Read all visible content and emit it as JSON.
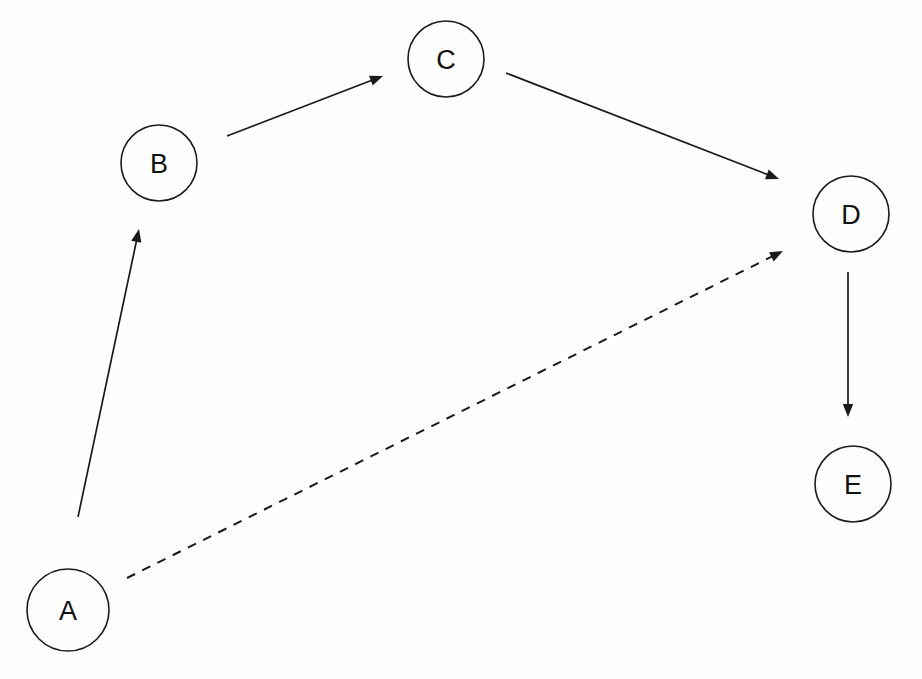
{
  "diagram": {
    "background_color": "#fefefe",
    "stroke_color": "#1a1a1a",
    "label_color": "#111111",
    "nodes": [
      {
        "id": "A",
        "label": "A",
        "cx": 68,
        "cy": 610,
        "r": 41
      },
      {
        "id": "B",
        "label": "B",
        "cx": 159,
        "cy": 163,
        "r": 38
      },
      {
        "id": "C",
        "label": "C",
        "cx": 446,
        "cy": 59,
        "r": 38
      },
      {
        "id": "D",
        "label": "D",
        "cx": 851,
        "cy": 214,
        "r": 38
      },
      {
        "id": "E",
        "label": "E",
        "cx": 853,
        "cy": 484,
        "r": 38
      }
    ],
    "edges": [
      {
        "id": "A-B",
        "from": "A",
        "to": "B",
        "style": "solid",
        "arrowhead": true,
        "x1": 78,
        "y1": 517,
        "x2": 139,
        "y2": 229
      },
      {
        "id": "B-C",
        "from": "B",
        "to": "C",
        "style": "solid",
        "arrowhead": true,
        "x1": 227,
        "y1": 136,
        "x2": 383,
        "y2": 76
      },
      {
        "id": "C-D",
        "from": "C",
        "to": "D",
        "style": "solid",
        "arrowhead": true,
        "x1": 506,
        "y1": 73,
        "x2": 779,
        "y2": 179
      },
      {
        "id": "A-D",
        "from": "A",
        "to": "D",
        "style": "dashed",
        "arrowhead": true,
        "x1": 127,
        "y1": 578,
        "x2": 783,
        "y2": 251
      },
      {
        "id": "D-E",
        "from": "D",
        "to": "E",
        "style": "solid",
        "arrowhead": true,
        "x1": 848,
        "y1": 272,
        "x2": 848,
        "y2": 417
      }
    ]
  }
}
